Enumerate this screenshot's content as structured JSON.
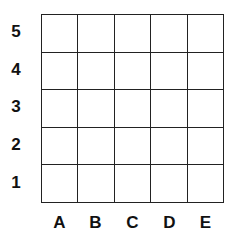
{
  "grid": {
    "rows": [
      "5",
      "4",
      "3",
      "2",
      "1"
    ],
    "columns": [
      "A",
      "B",
      "C",
      "D",
      "E"
    ],
    "line_color": "#222222",
    "background": "#ffffff"
  }
}
